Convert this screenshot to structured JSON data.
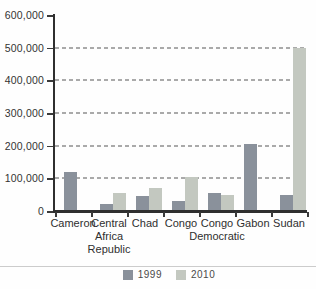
{
  "chart_data": {
    "type": "bar",
    "title": "",
    "xlabel": "",
    "ylabel": "",
    "ylim": [
      0,
      600000
    ],
    "grid": "horizontal-dashed",
    "legend_position": "bottom",
    "categories": [
      "Cameron",
      "Central\nAfrica\nRepublic",
      "Chad",
      "Congo",
      "Congo\nDemocratic",
      "Gabon",
      "Sudan"
    ],
    "series": [
      {
        "name": "1999",
        "color": "#8a919b",
        "values": [
          120000,
          20000,
          47000,
          30000,
          55000,
          205000,
          48000
        ]
      },
      {
        "name": "2010",
        "color": "#c3c8c0",
        "values": [
          null,
          55000,
          70000,
          103000,
          50000,
          null,
          500000
        ]
      }
    ],
    "y_ticks": [
      {
        "value": 600000,
        "label": "600,000"
      },
      {
        "value": 500000,
        "label": "500,000"
      },
      {
        "value": 400000,
        "label": "400,000"
      },
      {
        "value": 300000,
        "label": "300,000"
      },
      {
        "value": 200000,
        "label": "200,000"
      },
      {
        "value": 100000,
        "label": "100,000"
      },
      {
        "value": 0,
        "label": "0"
      }
    ]
  },
  "legend": {
    "items": [
      {
        "label": "1999",
        "color": "#8a919b"
      },
      {
        "label": "2010",
        "color": "#c3c8c0"
      }
    ]
  },
  "colors": {
    "axis": "#2f2f2f",
    "gridline": "#9b9b9b",
    "divider": "#cccccc",
    "text": "#333333"
  }
}
